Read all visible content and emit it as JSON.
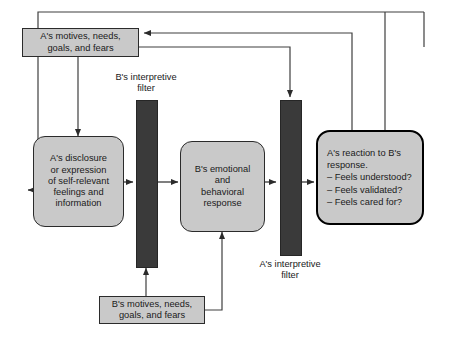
{
  "diagram": {
    "frame": {
      "stroke": "#3f3f3f"
    },
    "colors": {
      "node_fill": "#c9c9c9",
      "node_stroke": "#2b2b2b",
      "filter_fill": "#3a3a3a",
      "wire": "#3f3f3f",
      "emphasis_stroke": "#000000"
    },
    "nodes": [
      {
        "id": "a-motives",
        "name": "a-motives-box",
        "shape": "rect",
        "text": "A's motives, needs,\ngoals, and fears"
      },
      {
        "id": "a-disclosure",
        "name": "a-disclosure-box",
        "shape": "round",
        "text": "A's disclosure\nor expression\nof self-relevant\nfeelings and\ninformation"
      },
      {
        "id": "b-response",
        "name": "b-response-box",
        "shape": "round",
        "text": "B's emotional\nand\nbehavioral\nresponse"
      },
      {
        "id": "a-reaction",
        "name": "a-reaction-box",
        "shape": "heavy",
        "text": "A's reaction to B's\nresponse.\n– Feels understood?\n– Feels validated?\n– Feels cared for?"
      },
      {
        "id": "b-motives",
        "name": "b-motives-box",
        "shape": "rect",
        "text": "B's motives, needs,\ngoals, and fears"
      }
    ],
    "filters": [
      {
        "id": "b-filter",
        "name": "b-interpretive-filter-bar",
        "caption": "B's interpretive\nfilter"
      },
      {
        "id": "a-filter",
        "name": "a-interpretive-filter-bar",
        "caption": "A's interpretive\nfilter"
      }
    ]
  }
}
